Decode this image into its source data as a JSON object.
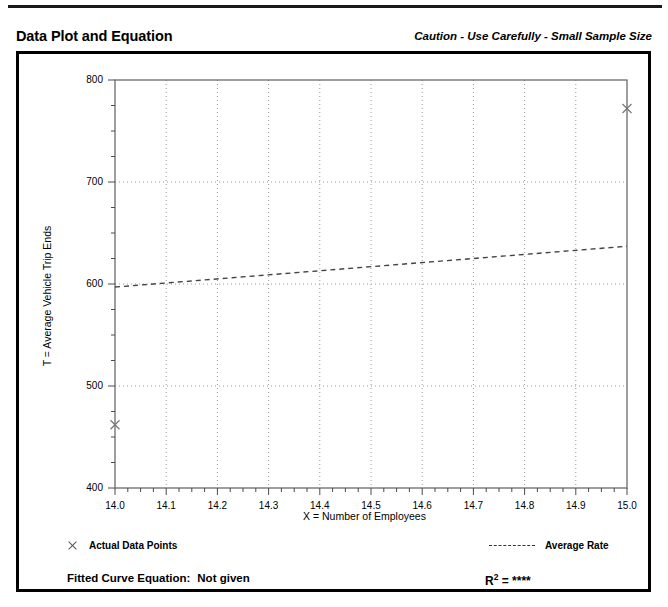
{
  "header": {
    "title": "Data Plot and Equation",
    "caution": "Caution - Use Carefully - Small Sample Size"
  },
  "legend": {
    "points_label": "Actual Data Points",
    "points_marker": "x-marker-icon",
    "rate_label": "Average Rate",
    "rate_marker": "dashed-line-icon"
  },
  "equation": {
    "label": "Fitted Curve Equation:",
    "value": "Not given",
    "r2_prefix": "R",
    "r2_sup": "2",
    "r2_eq": " = ",
    "r2_value": "****"
  },
  "chart_data": {
    "type": "scatter",
    "title": "",
    "xlabel": "X = Number of Employees",
    "ylabel": "T = Average Vehicle Trip Ends",
    "xlim": [
      14.0,
      15.0
    ],
    "ylim": [
      400,
      800
    ],
    "xticks": [
      "14.0",
      "14.1",
      "14.2",
      "14.3",
      "14.4",
      "14.5",
      "14.6",
      "14.7",
      "14.8",
      "14.9",
      "15.0"
    ],
    "xtick_values": [
      14.0,
      14.1,
      14.2,
      14.3,
      14.4,
      14.5,
      14.6,
      14.7,
      14.8,
      14.9,
      15.0
    ],
    "yticks": [
      "400",
      "500",
      "600",
      "700",
      "800"
    ],
    "ytick_values": [
      400,
      500,
      600,
      700,
      800
    ],
    "y_minor_step": 25,
    "grid": "dotted-major-both",
    "legend_position": "below-plot",
    "series": [
      {
        "name": "Actual Data Points",
        "type": "scatter",
        "marker": "x",
        "x": [
          14.0,
          15.0
        ],
        "y": [
          462,
          772
        ]
      },
      {
        "name": "Average Rate",
        "type": "line",
        "style": "dashed",
        "x": [
          14.0,
          15.0
        ],
        "y": [
          597,
          637
        ]
      }
    ]
  }
}
